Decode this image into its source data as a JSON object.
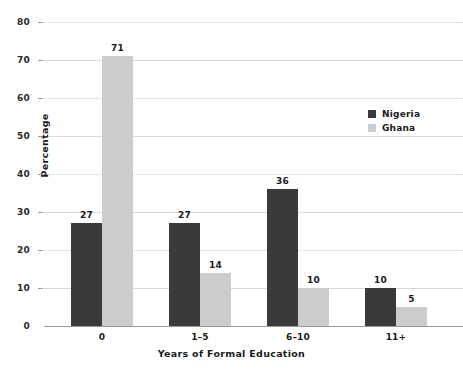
{
  "chart_data": {
    "type": "bar",
    "title": "",
    "xlabel": "Years of Formal Education",
    "ylabel": "Percentage",
    "categories": [
      "0",
      "1–5",
      "6–10",
      "11+"
    ],
    "series": [
      {
        "name": "Nigeria",
        "color": "#3a3a3a",
        "values": [
          27,
          27,
          36,
          10
        ]
      },
      {
        "name": "Ghana",
        "color": "#cccccc",
        "values": [
          71,
          14,
          10,
          5
        ]
      }
    ],
    "ylim": [
      0,
      80
    ],
    "ytick_values": [
      0,
      10,
      20,
      30,
      40,
      50,
      60,
      70,
      80
    ],
    "ytick_labels": [
      "0",
      "10",
      "20",
      "30",
      "40",
      "50",
      "60",
      "70",
      "80"
    ],
    "grid": true,
    "grid_axis": "y",
    "legend_position": "upper right",
    "data_labels": true
  },
  "legend": {
    "items": [
      {
        "label": "Nigeria"
      },
      {
        "label": "Ghana"
      }
    ]
  },
  "caption": {
    "text": ""
  }
}
